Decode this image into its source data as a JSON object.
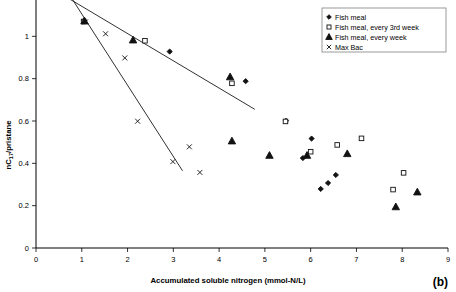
{
  "chart_data": {
    "type": "scatter",
    "title": "",
    "xlabel": "Accumulated soluble nitrogen (mmol-N/L)",
    "ylabel": "nC17/pristane",
    "ylabel_parts": {
      "pre": "nC",
      "sub": "17",
      "post": "/pristane"
    },
    "xlim": [
      0,
      9
    ],
    "ylim": [
      0,
      1.2
    ],
    "xticks": [
      0,
      1,
      2,
      3,
      4,
      5,
      6,
      7,
      8,
      9
    ],
    "xtick_labels": [
      "0",
      "1",
      "2",
      "3",
      "4",
      "5",
      "6",
      "7",
      "8",
      "9"
    ],
    "yticks": [
      0,
      0.2,
      0.4,
      0.6,
      0.8,
      1.0
    ],
    "ytick_labels": [
      "0",
      "0.2",
      "0.4",
      "0.6",
      "0.8",
      "1"
    ],
    "grid": false,
    "legend_position": "top-right",
    "panel_label": "(b)",
    "series": [
      {
        "name": "Fish meal",
        "marker": "diamond",
        "points": [
          [
            1.05,
            1.075
          ],
          [
            2.92,
            0.928
          ],
          [
            4.58,
            0.788
          ],
          [
            5.46,
            0.601
          ],
          [
            6.02,
            0.517
          ],
          [
            5.83,
            0.425
          ],
          [
            6.55,
            0.345
          ],
          [
            6.38,
            0.307
          ],
          [
            6.22,
            0.279
          ]
        ]
      },
      {
        "name": "Fish meal, every 3rd week",
        "marker": "square",
        "points": [
          [
            1.04,
            1.07
          ],
          [
            2.38,
            0.979
          ],
          [
            4.28,
            0.778
          ],
          [
            5.45,
            0.598
          ],
          [
            6.58,
            0.487
          ],
          [
            7.11,
            0.518
          ],
          [
            6.0,
            0.455
          ],
          [
            8.03,
            0.355
          ],
          [
            7.8,
            0.276
          ]
        ]
      },
      {
        "name": "Fish meal, every week",
        "marker": "triangle",
        "points": [
          [
            1.06,
            1.072
          ],
          [
            2.12,
            0.982
          ],
          [
            4.24,
            0.808
          ],
          [
            4.28,
            0.505
          ],
          [
            5.1,
            0.437
          ],
          [
            5.92,
            0.437
          ],
          [
            6.8,
            0.445
          ],
          [
            8.33,
            0.264
          ],
          [
            7.86,
            0.194
          ]
        ]
      },
      {
        "name": "Max Bac",
        "marker": "cross",
        "points": [
          [
            1.08,
            1.068
          ],
          [
            1.52,
            1.012
          ],
          [
            1.94,
            0.898
          ],
          [
            2.22,
            0.599
          ],
          [
            3.35,
            0.478
          ],
          [
            2.99,
            0.408
          ],
          [
            3.58,
            0.357
          ]
        ]
      }
    ],
    "fit_lines": [
      {
        "name": "upper-trend",
        "x": [
          0.55,
          4.78
        ],
        "y": [
          1.2,
          0.655
        ]
      },
      {
        "name": "lower-trend",
        "x": [
          0.72,
          3.2
        ],
        "y": [
          1.2,
          0.365
        ]
      }
    ]
  },
  "legend": {
    "items": [
      {
        "label": "Fish meal",
        "marker": "diamond"
      },
      {
        "label": "Fish meal, every 3rd week",
        "marker": "square"
      },
      {
        "label": "Fish meal, every week",
        "marker": "triangle"
      },
      {
        "label": "Max Bac",
        "marker": "cross"
      }
    ]
  }
}
